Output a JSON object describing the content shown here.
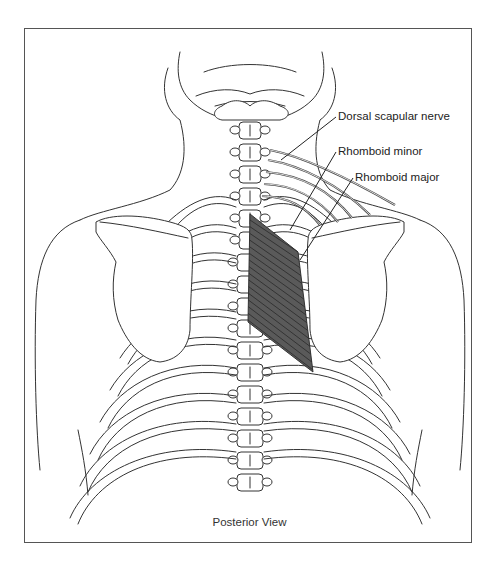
{
  "figure": {
    "view_caption": "Posterior View",
    "labels": {
      "dorsal_scapular_nerve": "Dorsal scapular nerve",
      "rhomboid_minor": "Rhomboid minor",
      "rhomboid_major": "Rhomboid major"
    },
    "colors": {
      "muscle_fill": "#5a5a5a",
      "outline": "#333333",
      "frame": "#555555",
      "background": "#ffffff"
    }
  }
}
